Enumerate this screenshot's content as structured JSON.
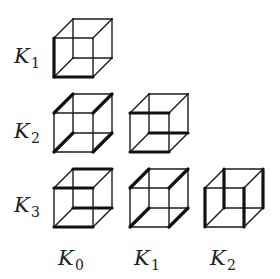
{
  "diagram": {
    "title": "",
    "row_labels": [
      {
        "base": "K",
        "sub": "1"
      },
      {
        "base": "K",
        "sub": "2"
      },
      {
        "base": "K",
        "sub": "3"
      }
    ],
    "column_labels": [
      {
        "base": "K",
        "sub": "0"
      },
      {
        "base": "K",
        "sub": "1"
      },
      {
        "base": "K",
        "sub": "2"
      }
    ],
    "cube_geometry": {
      "size": 39,
      "depth_dx": 19,
      "depth_dy": -19
    },
    "cubes": [
      {
        "row": 0,
        "col": 0,
        "front_x": 54,
        "front_y": 38,
        "thick_edges": [
          "FTL-FBL",
          "FBL-FBR"
        ]
      },
      {
        "row": 1,
        "col": 0,
        "front_x": 54,
        "front_y": 113,
        "thick_edges": [
          "FTL-BTL",
          "FTR-BTR",
          "FBL-BBL",
          "FBR-BBR"
        ]
      },
      {
        "row": 1,
        "col": 1,
        "front_x": 130,
        "front_y": 113,
        "thick_edges": [
          "FTL-FTR",
          "FBL-FBR",
          "BBL-BBR"
        ]
      },
      {
        "row": 2,
        "col": 0,
        "front_x": 54,
        "front_y": 188,
        "thick_edges": [
          "FTL-FTR",
          "BTL-BTR",
          "FBL-FBR",
          "BBL-BBR"
        ]
      },
      {
        "row": 2,
        "col": 1,
        "front_x": 130,
        "front_y": 188,
        "thick_edges": [
          "FTL-BTL",
          "FTR-BTR",
          "FBL-BBL",
          "FBR-BBR"
        ]
      },
      {
        "row": 2,
        "col": 2,
        "front_x": 205,
        "front_y": 188,
        "thick_edges": [
          "FTL-FBL",
          "FTR-FBR",
          "BTL-BBL",
          "BTR-BBR"
        ]
      }
    ],
    "colors": {
      "line": "#1a1a1a",
      "background": "#ffffff",
      "text": "#222222"
    }
  }
}
